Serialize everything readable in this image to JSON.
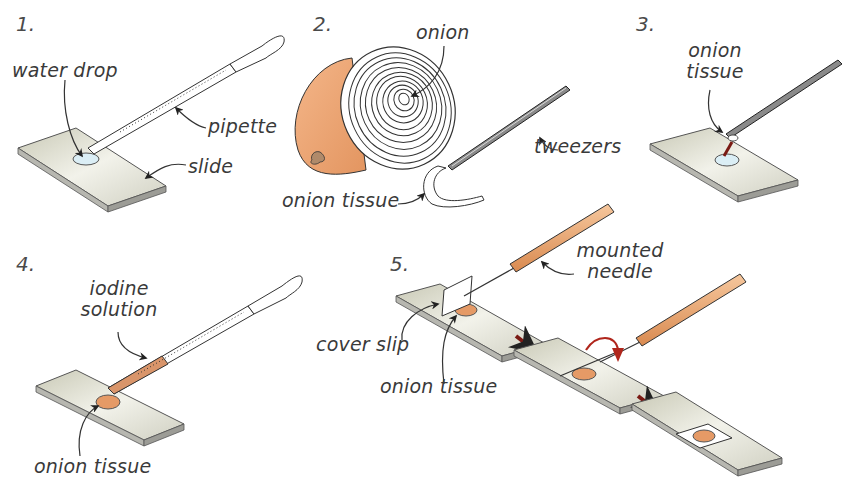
{
  "diagram": {
    "colors": {
      "slide_top": "#e4e4d8",
      "slide_edge": "#a8a8a8",
      "onion_skin": "#eea673",
      "iodine": "#d9956a",
      "needle_handle": "#eaa46c",
      "arrow_red": "#7a1a14",
      "water": "#dbeef5",
      "outline": "#333333"
    },
    "steps": [
      {
        "number": "1.",
        "labels": {
          "water_drop": "water drop",
          "pipette": "pipette",
          "slide": "slide"
        }
      },
      {
        "number": "2.",
        "labels": {
          "onion": "onion",
          "tweezers": "tweezers",
          "onion_tissue": "onion tissue"
        }
      },
      {
        "number": "3.",
        "labels": {
          "onion_tissue_line1": "onion",
          "onion_tissue_line2": "tissue"
        }
      },
      {
        "number": "4.",
        "labels": {
          "iodine_line1": "iodine",
          "iodine_line2": "solution",
          "onion_tissue": "onion tissue"
        }
      },
      {
        "number": "5.",
        "labels": {
          "needle_line1": "mounted",
          "needle_line2": "needle",
          "cover_slip": "cover slip",
          "onion_tissue": "onion tissue"
        }
      }
    ]
  }
}
